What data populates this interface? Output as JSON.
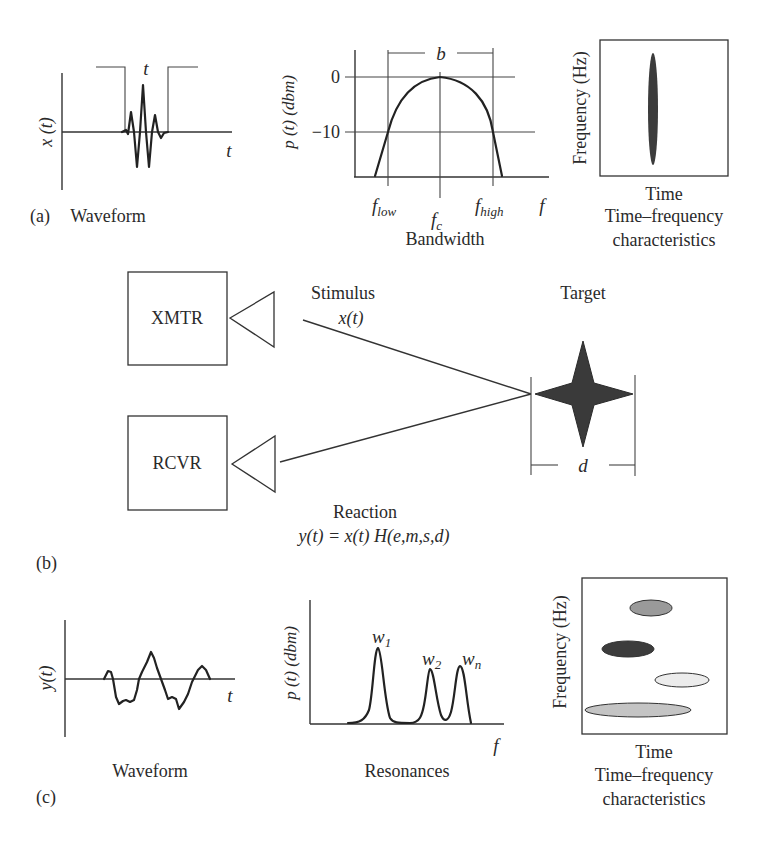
{
  "figure": {
    "panels": {
      "a": {
        "tag": "(a)",
        "waveform": {
          "caption": "Waveform",
          "ylabel": "x (t)",
          "xlabel": "t",
          "pulse_width_label": "t"
        },
        "bandwidth": {
          "caption": "Bandwidth",
          "ylabel": "p (t) (dbm)",
          "xlabel": "f",
          "ticks_y": [
            "0",
            "−10"
          ],
          "f_low": "f",
          "f_low_sub": "low",
          "f_c": "f",
          "f_c_sub": "c",
          "f_high": "f",
          "f_high_sub": "high",
          "bandwidth_label": "b"
        },
        "time_frequency": {
          "ylabel": "Frequency (Hz)",
          "xlabel": "Time",
          "caption_line1": "Time–frequency",
          "caption_line2": "characteristics"
        }
      },
      "b": {
        "tag": "(b)",
        "transmitter": "XMTR",
        "receiver": "RCVR",
        "stimulus_label": "Stimulus",
        "stimulus_expr": "x(t)",
        "target_label": "Target",
        "target_size_label": "d",
        "reaction_label": "Reaction",
        "reaction_expr": "y(t) = x(t) H(e,m,s,d)"
      },
      "c": {
        "tag": "(c)",
        "waveform": {
          "caption": "Waveform",
          "ylabel": "y(t)",
          "xlabel": "t"
        },
        "resonances": {
          "caption": "Resonances",
          "ylabel": "p (t) (dbm)",
          "xlabel": "f",
          "peaks": [
            {
              "label": "w",
              "sub": "1"
            },
            {
              "label": "w",
              "sub": "2"
            },
            {
              "label": "w",
              "sub": "n"
            }
          ]
        },
        "time_frequency": {
          "ylabel": "Frequency (Hz)",
          "xlabel": "Time",
          "caption_line1": "Time–frequency",
          "caption_line2": "characteristics"
        }
      }
    },
    "colors": {
      "line": "#333333",
      "target_fill": "#3a3a3a",
      "tf_ellipse_dark": "#3c3c3c",
      "tf_ellipse_mid": "#9a9a9a",
      "tf_ellipse_light": "#c4c4c4",
      "tf_ellipse_pale": "#ececec"
    }
  }
}
